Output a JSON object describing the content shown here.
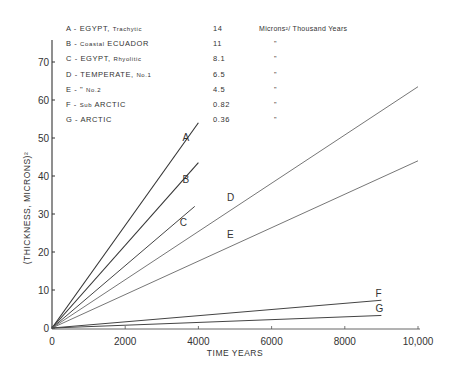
{
  "chart_data": {
    "type": "line",
    "title": "",
    "xlabel": "TIME YEARS",
    "ylabel": "(THICKNESS, MICRONS)²",
    "xlim": [
      0,
      10000
    ],
    "ylim": [
      0,
      75
    ],
    "x_ticks": [
      "0",
      "2000",
      "4000",
      "6000",
      "8000",
      "10,000"
    ],
    "y_ticks": [
      "0",
      "10",
      "20",
      "30",
      "40",
      "50",
      "60",
      "70"
    ],
    "grid": false,
    "legend_position": "top-left (text table)",
    "series": [
      {
        "id": "A",
        "name": "EGYPT, Trachytic",
        "rate": "14",
        "x": [
          0,
          4000
        ],
        "y": [
          0,
          54
        ]
      },
      {
        "id": "B",
        "name": "Coastal ECUADOR",
        "rate": "11",
        "x": [
          0,
          4000
        ],
        "y": [
          0,
          43.5
        ]
      },
      {
        "id": "C",
        "name": "EGYPT, Rhyolitic",
        "rate": "8.1",
        "x": [
          0,
          3900
        ],
        "y": [
          0,
          32
        ]
      },
      {
        "id": "D",
        "name": "TEMPERATE, No.1",
        "rate": "6.5",
        "x": [
          0,
          10000
        ],
        "y": [
          0,
          63.5
        ]
      },
      {
        "id": "E",
        "name": "TEMPERATE, No.2",
        "rate": "4.5",
        "x": [
          0,
          10000
        ],
        "y": [
          0,
          44
        ]
      },
      {
        "id": "F",
        "name": "Sub ARCTIC",
        "rate": "0.82",
        "x": [
          0,
          9000
        ],
        "y": [
          0,
          7.3
        ]
      },
      {
        "id": "G",
        "name": "ARCTIC",
        "rate": "0.36",
        "x": [
          0,
          9000
        ],
        "y": [
          0,
          3.3
        ]
      }
    ],
    "rate_unit": "Microns²/ Thousand Years"
  },
  "legend": {
    "rows": [
      {
        "label": "A - EGYPT, ",
        "label_small": "Trachytic",
        "value": "14",
        "unit": "Microns²/ Thousand Years"
      },
      {
        "label": "B - ",
        "label_small": "Coastal",
        "label_after": " ECUADOR",
        "value": "11",
        "unit": "\""
      },
      {
        "label": "C - EGYPT, ",
        "label_small": "Rhyolitic",
        "value": "8.1",
        "unit": "\""
      },
      {
        "label": "D - TEMPERATE, ",
        "label_small": "No.1",
        "value": "6.5",
        "unit": "\""
      },
      {
        "label": "E -     \"        ",
        "label_small": "No.2",
        "value": "4.5",
        "unit": "\""
      },
      {
        "label": "F - ",
        "label_small": "Sub",
        "label_after": " ARCTIC",
        "value": "0.82",
        "unit": "\""
      },
      {
        "label": "G - ARCTIC",
        "label_small": "",
        "value": "0.36",
        "unit": "\""
      }
    ]
  },
  "axes": {
    "x_title": "TIME YEARS",
    "y_title": "(THICKNESS, MICRONS)²",
    "x_ticks": [
      "0",
      "2000",
      "4000",
      "6000",
      "8000",
      "10,000"
    ],
    "y_ticks": [
      "0",
      "10",
      "20",
      "30",
      "40",
      "50",
      "60",
      "70"
    ]
  },
  "curve_labels": [
    "A",
    "B",
    "C",
    "D",
    "E",
    "F",
    "G"
  ]
}
